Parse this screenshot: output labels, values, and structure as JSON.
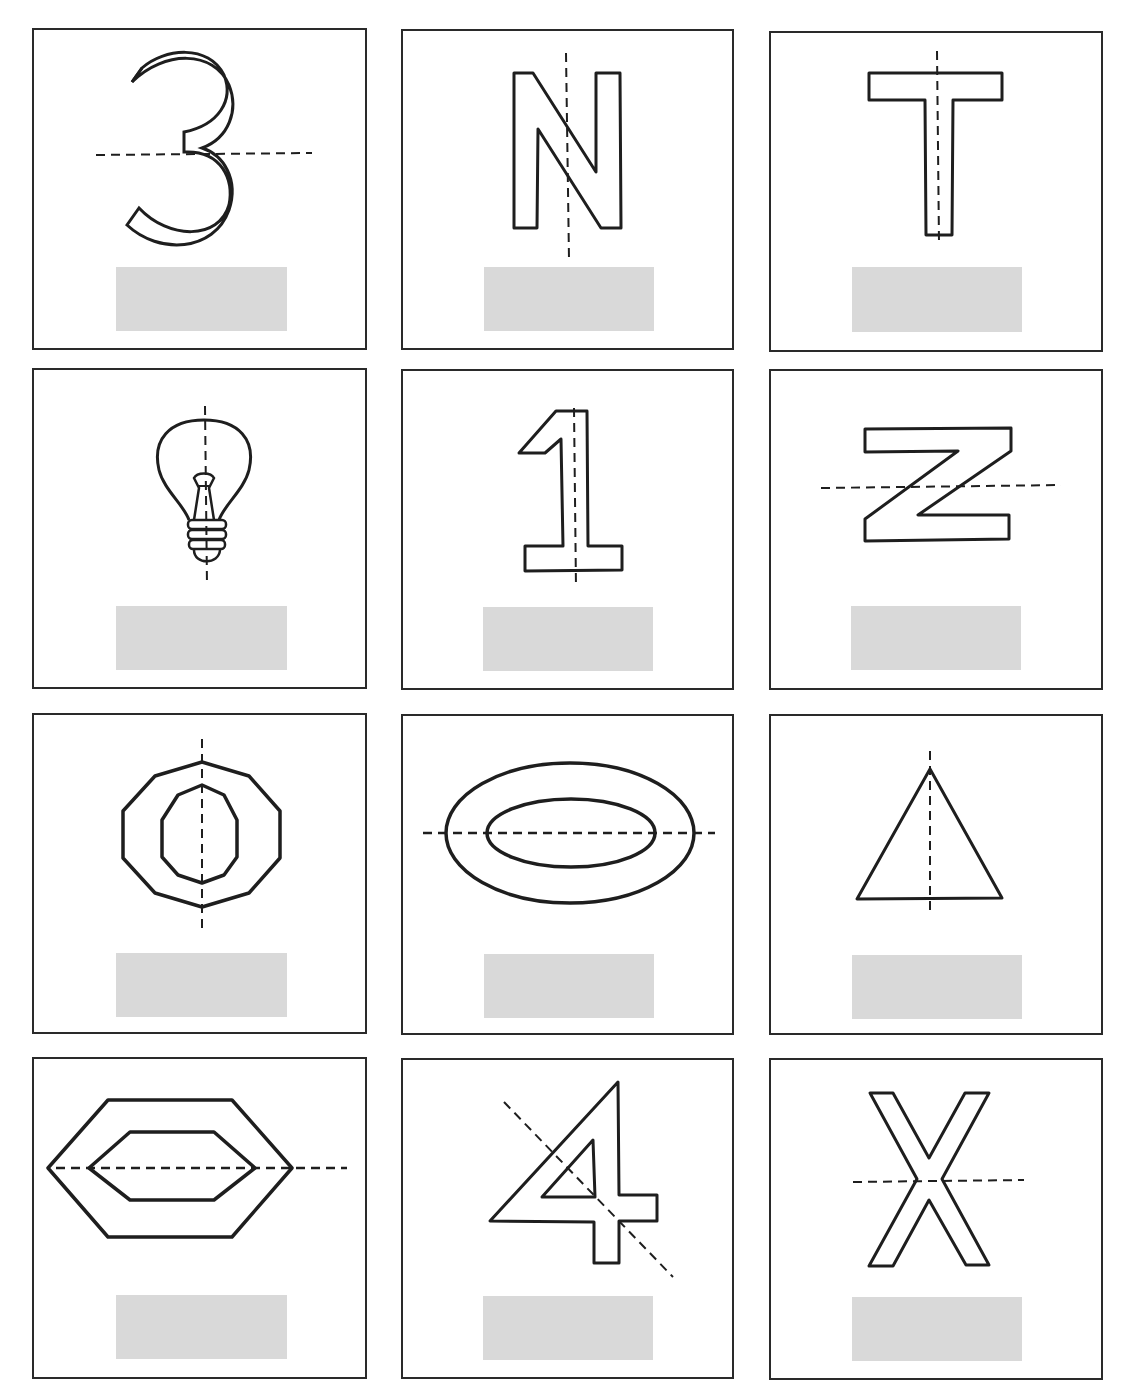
{
  "worksheet": {
    "topic": "Lines of symmetry",
    "colors": {
      "stroke": "#1e1e1e",
      "answer_box": "#d9d9d9",
      "border": "#2a2a2a"
    },
    "cards": [
      {
        "id": 1,
        "figure": "3",
        "symmetry_line": "horizontal",
        "answer": ""
      },
      {
        "id": 2,
        "figure": "N",
        "symmetry_line": "vertical",
        "answer": ""
      },
      {
        "id": 3,
        "figure": "T",
        "symmetry_line": "vertical",
        "answer": ""
      },
      {
        "id": 4,
        "figure": "light bulb",
        "symmetry_line": "vertical",
        "answer": ""
      },
      {
        "id": 5,
        "figure": "1",
        "symmetry_line": "vertical",
        "answer": ""
      },
      {
        "id": 6,
        "figure": "Z",
        "symmetry_line": "horizontal",
        "answer": ""
      },
      {
        "id": 7,
        "figure": "double decagon ring",
        "symmetry_line": "vertical",
        "answer": ""
      },
      {
        "id": 8,
        "figure": "double ellipse ring",
        "symmetry_line": "horizontal",
        "answer": ""
      },
      {
        "id": 9,
        "figure": "triangle",
        "symmetry_line": "vertical",
        "answer": ""
      },
      {
        "id": 10,
        "figure": "double hexagon ring",
        "symmetry_line": "horizontal",
        "answer": ""
      },
      {
        "id": 11,
        "figure": "4",
        "symmetry_line": "diagonal",
        "answer": ""
      },
      {
        "id": 12,
        "figure": "X",
        "symmetry_line": "horizontal",
        "answer": ""
      }
    ]
  }
}
